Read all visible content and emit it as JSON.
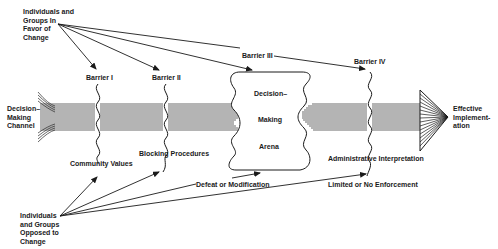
{
  "diagram": {
    "type": "flow-barrier-diagram",
    "colors": {
      "ink": "#1a1a1a",
      "background": "#ffffff"
    },
    "actors": {
      "in_favor": "Individuals and\nGroups In\nFavor of\nChange",
      "opposed": "Individuals\nand Groups\nOpposed to\nChange"
    },
    "channel": {
      "label": "Decision–\nMaking\nChannel",
      "outcome": "Effective\nImplement-\n   ation"
    },
    "barriers": [
      {
        "name": "Barrier I",
        "mechanism": "Community Values"
      },
      {
        "name": "Barrier II",
        "mechanism": "Blocking Procedures"
      },
      {
        "name": "Barrier III",
        "mechanism": "Defeat or Modification"
      },
      {
        "name": "Barrier IV",
        "mechanism": "Administrative Interpretation"
      }
    ],
    "arena": {
      "line1": "Decision–",
      "line2": "Making",
      "line3": "Arena"
    },
    "enforcement": "Limited or No Enforcement"
  }
}
